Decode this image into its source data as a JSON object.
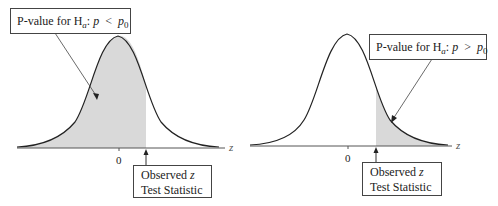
{
  "left_panel": {
    "label_prefix": "P-value for H",
    "label_sub": "a",
    "label_colon": ": ",
    "label_p": "p",
    "label_op": "<",
    "label_p0": "p",
    "label_p0_sub": "0",
    "tick_zero": "0",
    "axis_label": "z",
    "observed_line1_text": "Observed ",
    "observed_line1_var": "z",
    "observed_line2": "Test Statistic"
  },
  "right_panel": {
    "label_prefix": "P-value for H",
    "label_sub": "a",
    "label_colon": ": ",
    "label_p": "p",
    "label_op": ">",
    "label_p0": "p",
    "label_p0_sub": "0",
    "tick_zero": "0",
    "axis_label": "z",
    "observed_line1_text": "Observed ",
    "observed_line1_var": "z",
    "observed_line2": "Test Statistic"
  },
  "colors": {
    "shade": "#d9d9d9",
    "curve": "#222222",
    "axis": "#555555"
  }
}
